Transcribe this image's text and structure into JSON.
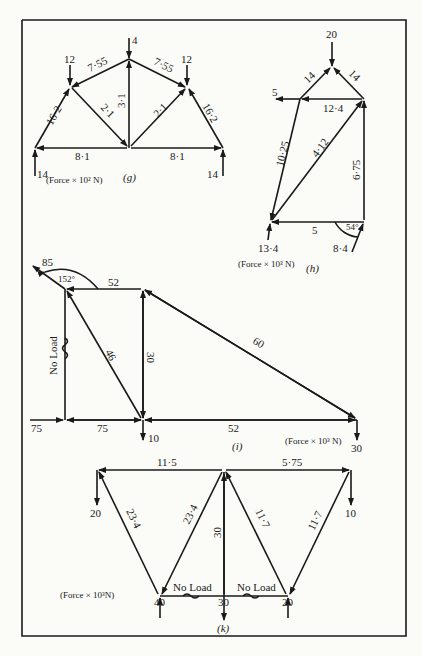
{
  "figures": {
    "g": {
      "caption": "(g)",
      "units": "(Force × 10² N)",
      "loads": [
        "4",
        "12",
        "12"
      ],
      "reactions": [
        "14",
        "14"
      ],
      "members": {
        "left_rafter_upper": "7·55",
        "right_rafter_upper": "7·55",
        "left_rafter_lower": "16·2",
        "right_rafter_lower": "16·2",
        "left_diagonal": "2·1",
        "right_diagonal": "2·1",
        "center_vertical": "3·1",
        "left_tie": "8·1",
        "right_tie": "8·1"
      }
    },
    "h": {
      "caption": "(h)",
      "units": "(Force × 10³ N)",
      "loads": {
        "top": "20",
        "left_horizontal": "5"
      },
      "reactions": {
        "left": "13·4",
        "right": "8·4"
      },
      "angle": "54°",
      "members": {
        "left_top": "14",
        "right_top": "14",
        "top_horizontal": "12·4",
        "left_long": "10·25",
        "diagonal": "4·12",
        "right_vertical": "6·75",
        "bottom": "5"
      }
    },
    "i": {
      "caption": "(i)",
      "units": "(Force × 10³ N)",
      "loads": {
        "top_left": "85",
        "bottom_mid": "10",
        "bottom_right": "30",
        "left_horizontal": "75"
      },
      "angle": "152°",
      "members": {
        "top": "52",
        "left_vertical": "No Load",
        "diagonal": "46",
        "mid_vertical": "30",
        "long_diagonal": "60",
        "bottom_left": "75",
        "bottom_right": "52"
      }
    },
    "k": {
      "caption": "(k)",
      "units": "(Force × 10³N)",
      "loads": {
        "left": "20",
        "right": "10",
        "center": "30"
      },
      "reactions": {
        "left": "40",
        "right": "20"
      },
      "members": {
        "top_left": "11·5",
        "top_right": "5·75",
        "left_outer": "23·4",
        "left_inner": "23·4",
        "center_vertical": "30",
        "right_inner": "11·7",
        "right_outer": "11·7",
        "bottom_left": "No Load",
        "bottom_right": "No Load"
      }
    }
  }
}
